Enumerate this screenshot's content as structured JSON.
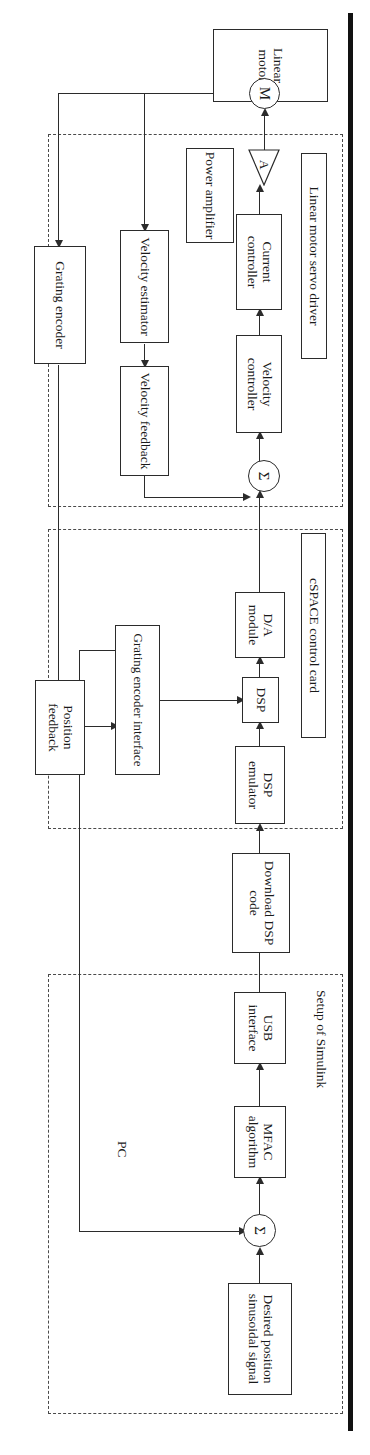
{
  "figure": {
    "orientation": "rotated-90",
    "groups": [
      {
        "id": "servo_driver",
        "label": "Linear motor servo driver"
      },
      {
        "id": "cspace",
        "label": "cSPACE control card"
      },
      {
        "id": "pc",
        "label": "PC"
      }
    ],
    "subgroup_labels": [
      {
        "id": "simulink",
        "label": "Setup of Simulink"
      }
    ],
    "blocks": [
      {
        "id": "linear_motor",
        "label": "Linear motor"
      },
      {
        "id": "power_amplifier",
        "label": "Power amplifier"
      },
      {
        "id": "current_controller",
        "label": "Current controller"
      },
      {
        "id": "velocity_controller",
        "label": "Velocity controller"
      },
      {
        "id": "velocity_estimator",
        "label": "Velocity estimator"
      },
      {
        "id": "velocity_feedback",
        "label": "Velocity feedback"
      },
      {
        "id": "grating_encoder",
        "label": "Grating encoder"
      },
      {
        "id": "da_module",
        "label": "D/A module"
      },
      {
        "id": "dsp",
        "label": "DSP"
      },
      {
        "id": "dsp_emulator",
        "label": "DSP emulator"
      },
      {
        "id": "grating_encoder_interface",
        "label": "Grating encoder interface"
      },
      {
        "id": "position_feedback",
        "label": "Position feedback"
      },
      {
        "id": "download_dsp_code",
        "label": "Download DSP code"
      },
      {
        "id": "usb_interface",
        "label": "USB interface"
      },
      {
        "id": "mfac_algorithm",
        "label": "MFAC algorithm"
      },
      {
        "id": "desired_position",
        "label": "Desired position sinusoidal signal"
      }
    ],
    "nodes": [
      {
        "id": "motor_symbol",
        "label": "M"
      },
      {
        "id": "amplifier_symbol",
        "label": "A"
      },
      {
        "id": "sum_velocity",
        "label": "Σ"
      },
      {
        "id": "sum_position",
        "label": "Σ"
      }
    ],
    "colors": {
      "line": "#2b2b2b",
      "dashed_group": "#4a4a4a",
      "text": "#1a1a1a",
      "edge_bar": "#111111",
      "background": "#ffffff"
    }
  }
}
